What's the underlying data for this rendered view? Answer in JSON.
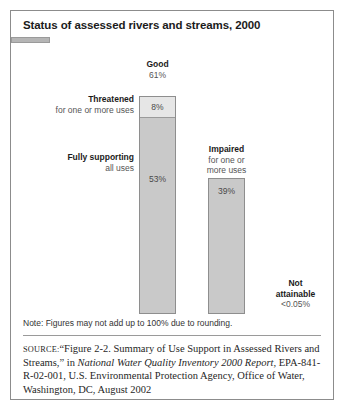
{
  "figure": {
    "title": "Status of assessed rivers and streams, 2000",
    "note": "Note: Figures may not add up to 100% due to rounding.",
    "source": {
      "label": "SOURCE:",
      "text_before_italic": "“Figure 2-2. Summary of Use Support in Assessed Rivers and Streams,” in ",
      "italic_title": "National Water Quality Inventory 2000 Report,",
      "text_after_italic": " EPA-841-R-02-001, U.S. Environmental Protection Agency, Office of Water, Washington, DC, August 2002"
    }
  },
  "labels": {
    "good": {
      "heading": "Good",
      "value": "61%"
    },
    "threatened": {
      "heading": "Threatened",
      "sub": "for one or more uses",
      "value": "8%"
    },
    "fully_supporting": {
      "heading": "Fully supporting",
      "sub": "all uses",
      "value": "53%"
    },
    "impaired": {
      "heading": "Impaired",
      "sub_line1": "for one or",
      "sub_line2": "more uses",
      "value": "39%"
    },
    "not_attainable": {
      "heading_line1": "Not",
      "heading_line2": "attainable",
      "value": "<0.05%"
    }
  },
  "chart_data": {
    "type": "bar",
    "title": "Status of assessed rivers and streams, 2000",
    "xlabel": "",
    "ylabel": "",
    "ylim": [
      0,
      61
    ],
    "grid": false,
    "legend": "none",
    "note": "Note: Figures may not add up to 100% due to rounding.",
    "units": "percent of assessed rivers and streams",
    "categories": [
      "Good",
      "Impaired",
      "Not attainable"
    ],
    "values": [
      61,
      39,
      0.05
    ],
    "stacked": true,
    "bars": [
      {
        "category": "Good",
        "total": 61,
        "total_label": "61%",
        "segments": [
          {
            "name": "Threatened for one or more uses",
            "value": 8,
            "label": "8%",
            "color": "#e6e6e6"
          },
          {
            "name": "Fully supporting all uses",
            "value": 53,
            "label": "53%",
            "color": "#c9c9c9"
          }
        ]
      },
      {
        "category": "Impaired",
        "total": 39,
        "total_label": "39%",
        "segments": [
          {
            "name": "Impaired for one or more uses",
            "value": 39,
            "label": "39%",
            "color": "#c9c9c9"
          }
        ]
      },
      {
        "category": "Not attainable",
        "total": 0.05,
        "total_label": "<0.05%",
        "segments": [
          {
            "name": "Not attainable",
            "value": 0.05,
            "label": "<0.05%",
            "color": "#b5b5b5"
          }
        ]
      }
    ],
    "colors": {
      "segment_light": "#e6e6e6",
      "segment_mid": "#c9c9c9",
      "segment_dark": "#b5b5b5",
      "outline": "#8e8e8e",
      "text": "#1b1b1b"
    }
  }
}
